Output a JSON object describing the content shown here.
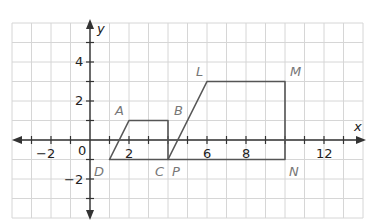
{
  "diagram": {
    "axes": {
      "x_label": "x",
      "y_label": "y",
      "x_range": [
        -4,
        14
      ],
      "y_range": [
        -4,
        6
      ],
      "origin_label": "0",
      "x_tick_labels": [
        {
          "value": -2,
          "text": "−2"
        },
        {
          "value": 2,
          "text": "2"
        },
        {
          "value": 6,
          "text": "6"
        },
        {
          "value": 8,
          "text": "8"
        },
        {
          "value": 12,
          "text": "12"
        }
      ],
      "y_tick_labels": [
        {
          "value": 4,
          "text": "4"
        },
        {
          "value": 2,
          "text": "2"
        },
        {
          "value": -2,
          "text": "−2"
        }
      ]
    },
    "colors": {
      "grid": "#d6d6d6",
      "axis": "#333333",
      "shape": "#555555",
      "point_label": "#777777"
    },
    "shapes": [
      {
        "name": "ABCD",
        "vertices": [
          {
            "label": "A",
            "x": 2,
            "y": 1
          },
          {
            "label": "B",
            "x": 4,
            "y": 1
          },
          {
            "label": "C",
            "x": 4,
            "y": -1
          },
          {
            "label": "D",
            "x": 1,
            "y": -1
          }
        ]
      },
      {
        "name": "LMNP",
        "vertices": [
          {
            "label": "L",
            "x": 6,
            "y": 3
          },
          {
            "label": "M",
            "x": 10,
            "y": 3
          },
          {
            "label": "N",
            "x": 10,
            "y": -1
          },
          {
            "label": "P",
            "x": 4,
            "y": -1
          }
        ]
      }
    ],
    "labels": {
      "A": "A",
      "B": "B",
      "C": "C",
      "D": "D",
      "L": "L",
      "M": "M",
      "N": "N",
      "P": "P"
    }
  }
}
